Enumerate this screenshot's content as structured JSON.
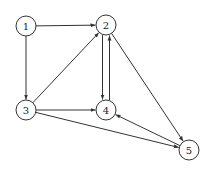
{
  "diagram": {
    "type": "directed-graph",
    "nodes": [
      {
        "id": "1",
        "label": "1",
        "x": 26,
        "y": 26
      },
      {
        "id": "2",
        "label": "2",
        "x": 106,
        "y": 25
      },
      {
        "id": "3",
        "label": "3",
        "x": 26,
        "y": 110
      },
      {
        "id": "4",
        "label": "4",
        "x": 106,
        "y": 110
      },
      {
        "id": "5",
        "label": "5",
        "x": 189,
        "y": 150
      }
    ],
    "edges": [
      {
        "from": "1",
        "to": "2"
      },
      {
        "from": "1",
        "to": "3"
      },
      {
        "from": "3",
        "to": "2"
      },
      {
        "from": "2",
        "to": "4"
      },
      {
        "from": "4",
        "to": "2"
      },
      {
        "from": "2",
        "to": "5"
      },
      {
        "from": "3",
        "to": "4"
      },
      {
        "from": "3",
        "to": "5"
      },
      {
        "from": "5",
        "to": "4"
      }
    ],
    "node_radius": 10,
    "stroke_color": "#333333"
  }
}
